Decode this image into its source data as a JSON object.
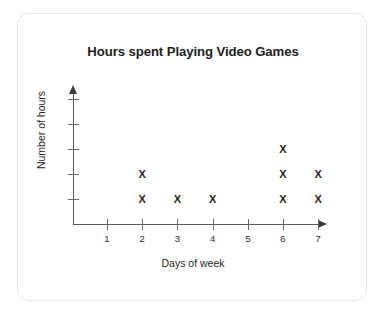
{
  "card": {
    "background_color": "#ffffff",
    "border_color": "#e8e8e8"
  },
  "chart_data": {
    "type": "scatter",
    "plot_style": "dot-plot-with-x-markers",
    "title": "Hours spent Playing Video Games",
    "xlabel": "Days of week",
    "ylabel": "Number of hours",
    "categories": [
      "1",
      "2",
      "3",
      "4",
      "5",
      "6",
      "7"
    ],
    "values": [
      0,
      2,
      1,
      1,
      0,
      3,
      2
    ],
    "x_tick_labels": [
      "1",
      "2",
      "3",
      "4",
      "5",
      "6",
      "7"
    ],
    "y_tick_labels": [
      "",
      "",
      "",
      "",
      ""
    ],
    "y_tick_count": 5,
    "xlim": [
      0,
      7
    ],
    "ylim": [
      0,
      5
    ],
    "grid": false,
    "legend": "none",
    "marker_glyph": "X",
    "marker_color": "#1f1f1f",
    "axis_color": "#5a5a5a",
    "points": [
      {
        "x": "2",
        "y": 1
      },
      {
        "x": "2",
        "y": 2
      },
      {
        "x": "3",
        "y": 1
      },
      {
        "x": "4",
        "y": 1
      },
      {
        "x": "6",
        "y": 1
      },
      {
        "x": "6",
        "y": 2
      },
      {
        "x": "6",
        "y": 3
      },
      {
        "x": "7",
        "y": 1
      },
      {
        "x": "7",
        "y": 2
      }
    ]
  }
}
